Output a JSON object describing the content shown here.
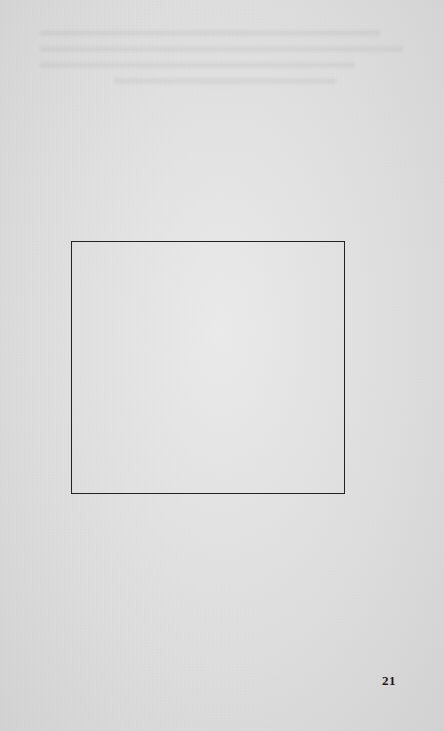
{
  "document": {
    "type": "scanned-book-page",
    "page_number": "21",
    "figure_box": {
      "content": "",
      "border_color": "#222222"
    },
    "colors": {
      "paper": "#dedede",
      "ink": "#1a1a1a"
    }
  }
}
